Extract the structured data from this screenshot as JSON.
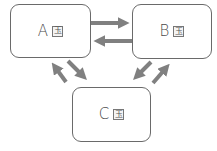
{
  "diagram": {
    "nodes": [
      {
        "id": "A",
        "label": "A",
        "icon": "玉"
      },
      {
        "id": "B",
        "label": "B",
        "icon": "玉"
      },
      {
        "id": "C",
        "label": "C",
        "icon": "玉"
      }
    ],
    "edges": [
      {
        "from": "A",
        "to": "B"
      },
      {
        "from": "B",
        "to": "A"
      },
      {
        "from": "A",
        "to": "C"
      },
      {
        "from": "C",
        "to": "A"
      },
      {
        "from": "B",
        "to": "C"
      },
      {
        "from": "C",
        "to": "B"
      }
    ],
    "colors": {
      "arrow": "#808080",
      "border": "#6a6a6a",
      "text": "#4a4a4a"
    }
  }
}
